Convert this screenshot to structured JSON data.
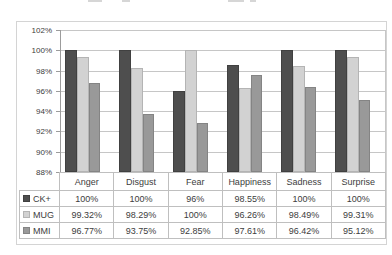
{
  "colors": {
    "gridline": "#c6c6c6",
    "axis": "#9c9c9c",
    "table_border": "#bfbfbf",
    "text": "#3d3d3d",
    "frame_border": "#d4d4d4",
    "background": "#ffffff"
  },
  "chart_data": {
    "type": "bar",
    "title": "",
    "categories": [
      "Anger",
      "Disgust",
      "Fear",
      "Happiness",
      "Sadness",
      "Surprise"
    ],
    "series": [
      {
        "name": "CK+",
        "color": "#4e4e4e",
        "border_color": "#404040",
        "values": [
          100,
          100,
          96,
          98.55,
          100,
          100
        ],
        "labels": [
          "100%",
          "100%",
          "96%",
          "98.55%",
          "100%",
          "100%"
        ]
      },
      {
        "name": "MUG",
        "color": "#d2d2d2",
        "border_color": "#b4b4b4",
        "values": [
          99.32,
          98.29,
          100,
          96.26,
          98.49,
          99.31
        ],
        "labels": [
          "99.32%",
          "98.29%",
          "100%",
          "96.26%",
          "98.49%",
          "99.31%"
        ]
      },
      {
        "name": "MMI",
        "color": "#999999",
        "border_color": "#848484",
        "values": [
          96.77,
          93.75,
          92.85,
          97.61,
          96.42,
          95.12
        ],
        "labels": [
          "96.77%",
          "93.75%",
          "92.85%",
          "97.61%",
          "96.42%",
          "95.12%"
        ]
      }
    ],
    "y_axis": {
      "min": 88,
      "max": 102,
      "step": 2,
      "tick_labels": [
        "102%",
        "100%",
        "98%",
        "96%",
        "94%",
        "92%",
        "90%",
        "88%"
      ]
    },
    "grid": true,
    "legend_position": "data-table-left-column",
    "data_table_shown": true
  }
}
